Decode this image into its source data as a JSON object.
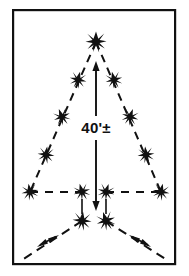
{
  "figure": {
    "background_color": "#ffffff",
    "ink_color": "#111111",
    "frame": {
      "name": "border-frame",
      "x": 12,
      "y": 9,
      "width": 164,
      "height": 256,
      "stroke_width": 2.2,
      "fill": "none"
    },
    "dimension": {
      "label": "40'±",
      "units": "feet",
      "value": 40,
      "tolerance": "±",
      "orientation": "vertical",
      "arrow": {
        "x": 96,
        "y_top": 62,
        "y_bottom": 210,
        "double_headed": true,
        "stroke_width": 1.8
      },
      "label_position": {
        "x": 96,
        "y": 128
      }
    },
    "markers": {
      "glyph": "star-burst",
      "count": 14,
      "points": [
        {
          "id": "apex",
          "x": 96,
          "y": 42,
          "size": 10.5
        },
        {
          "id": "left-upper",
          "x": 78,
          "y": 80,
          "size": 8.5
        },
        {
          "id": "left-mid",
          "x": 62,
          "y": 117,
          "size": 8.5
        },
        {
          "id": "left-lower",
          "x": 46,
          "y": 155,
          "size": 8.5
        },
        {
          "id": "left-corner",
          "x": 30,
          "y": 192,
          "size": 8.5
        },
        {
          "id": "right-upper",
          "x": 114,
          "y": 80,
          "size": 8.5
        },
        {
          "id": "right-mid",
          "x": 130,
          "y": 117,
          "size": 8.5
        },
        {
          "id": "right-lower",
          "x": 146,
          "y": 155,
          "size": 8.5
        },
        {
          "id": "right-corner",
          "x": 161,
          "y": 192,
          "size": 8.5
        },
        {
          "id": "base-inner-left",
          "x": 82,
          "y": 192,
          "size": 8.5
        },
        {
          "id": "base-inner-right",
          "x": 106,
          "y": 192,
          "size": 8.5
        },
        {
          "id": "vertex-left",
          "x": 82,
          "y": 221,
          "size": 9.5
        },
        {
          "id": "vertex-right",
          "x": 106,
          "y": 221,
          "size": 9.5
        }
      ]
    },
    "dashed_lines": [
      {
        "id": "triangle-left-leg",
        "x1": 96,
        "y1": 42,
        "x2": 30,
        "y2": 192
      },
      {
        "id": "triangle-right-leg",
        "x1": 96,
        "y1": 42,
        "x2": 161,
        "y2": 192
      },
      {
        "id": "base-left-segment",
        "x1": 30,
        "y1": 192,
        "x2": 82,
        "y2": 192
      },
      {
        "id": "base-right-segment",
        "x1": 106,
        "y1": 192,
        "x2": 161,
        "y2": 192
      },
      {
        "id": "splay-left-leg",
        "x1": 82,
        "y1": 221,
        "x2": 22,
        "y2": 260
      },
      {
        "id": "splay-right-leg",
        "x1": 106,
        "y1": 221,
        "x2": 167,
        "y2": 260
      }
    ],
    "tick_lines": [
      {
        "id": "tick-left",
        "x1": 82,
        "y1": 198,
        "x2": 82,
        "y2": 214
      },
      {
        "id": "tick-right",
        "x1": 106,
        "y1": 198,
        "x2": 106,
        "y2": 214
      }
    ],
    "splay_arrows": [
      {
        "id": "splay-arrow-left",
        "x": 48,
        "y": 240,
        "direction": "bidirectional-diagonal-up-right"
      },
      {
        "id": "splay-arrow-right",
        "x": 140,
        "y": 240,
        "direction": "bidirectional-diagonal-up-left"
      }
    ]
  }
}
